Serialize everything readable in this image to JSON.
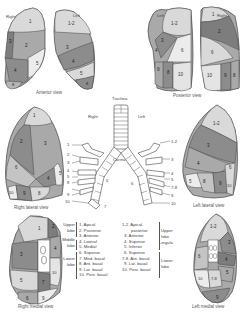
{
  "colors": {
    "light": "#d9d9d9",
    "mid": "#a9a9a9",
    "dark": "#7d7d7d",
    "paler": "#ececec",
    "outline": "#444444"
  },
  "views": {
    "anterior": {
      "caption": "Anterior view",
      "side_right": "Right",
      "side_left": "Left",
      "right_segments": [
        "1",
        "2",
        "3",
        "4",
        "5",
        "8"
      ],
      "left_segments": [
        "1-2",
        "3",
        "4",
        "5",
        "8"
      ]
    },
    "posterior": {
      "caption": "Posterior view",
      "side_left": "Left",
      "side_right": "Right",
      "left_segments": [
        "1-2",
        "3",
        "4",
        "6",
        "8",
        "9",
        "10"
      ],
      "right_segments": [
        "1",
        "2",
        "6",
        "10",
        "9",
        "8"
      ]
    },
    "right_lateral": {
      "caption": "Right lateral view",
      "segments": [
        "1",
        "2",
        "3",
        "4",
        "5",
        "6",
        "8",
        "9",
        "10"
      ]
    },
    "left_lateral": {
      "caption": "Left lateral view",
      "segments": [
        "1-2",
        "3",
        "4",
        "5",
        "6",
        "8",
        "9",
        "10"
      ]
    },
    "right_medial": {
      "caption": "Right medial view",
      "segments": [
        "1",
        "2",
        "3",
        "4",
        "5",
        "6",
        "7",
        "10",
        "9"
      ]
    },
    "left_medial": {
      "caption": "Left medial view",
      "segments": [
        "1-2",
        "3",
        "4",
        "5",
        "6",
        "7-8",
        "10",
        "9"
      ]
    }
  },
  "bronchi": {
    "trachea": "Trachea",
    "right": "Right",
    "left": "Left",
    "carina": "Carina",
    "right_numbers": [
      "1",
      "2",
      "3",
      "4",
      "5",
      "6",
      "7",
      "8",
      "9",
      "10"
    ],
    "left_numbers": [
      "1-2",
      "3",
      "4",
      "5",
      "6",
      "7-8",
      "9",
      "10"
    ]
  },
  "legend_right": {
    "groups": [
      {
        "lobe": "Upper lobe",
        "lobe_line1": "Upper",
        "lobe_line2": "lobe",
        "items": [
          "1. Apical",
          "2. Posterior",
          "3. Anterior"
        ]
      },
      {
        "lobe": "Middle lobe",
        "lobe_line1": "Middle",
        "lobe_line2": "lobe",
        "items": [
          "4. Lateral",
          "5. Medial"
        ]
      },
      {
        "lobe": "Lower lobe",
        "lobe_line1": "Lower",
        "lobe_line2": "lobe",
        "items": [
          "6. Superior",
          "7. Med. basal",
          "8. Ant. basal",
          "9. Lat. basal",
          "10. Post. basal"
        ]
      }
    ]
  },
  "legend_left": {
    "items": [
      "1-2. Apical-",
      "posterior",
      "3. Anterior",
      "4. Superior",
      "5. Inferior",
      "6. Superior",
      "7-8. Ant. basal",
      "9. Lat. basal",
      "10. Post. basal"
    ],
    "upper_lobe": "Upper lobe",
    "upper_line1": "Upper",
    "upper_line2": "lobe",
    "lingula": "Lingula",
    "lower_line1": "Lower",
    "lower_line2": "lobe"
  }
}
